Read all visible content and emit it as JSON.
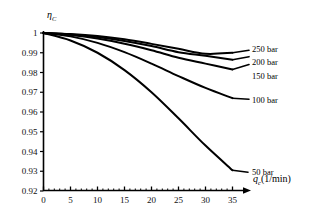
{
  "chart_data": {
    "type": "line",
    "title": "",
    "xlabel": "q_c(1/min)",
    "ylabel": "eta_C",
    "xlim": [
      0,
      35
    ],
    "ylim": [
      0.92,
      1.0
    ],
    "grid": false,
    "legend_position": "inline-right",
    "x_ticks": [
      0,
      5,
      10,
      15,
      20,
      25,
      30,
      35
    ],
    "x_tick_labels": [
      "0",
      "5",
      "10",
      "15",
      "20",
      "25",
      "30",
      "35"
    ],
    "y_ticks": [
      0.92,
      0.93,
      0.94,
      0.95,
      0.96,
      0.97,
      0.98,
      0.99,
      1.0
    ],
    "y_tick_labels": [
      "0.92",
      "0.93",
      "0.94",
      "0.95",
      "0.96",
      "0.97",
      "0.98",
      "0.99",
      "1"
    ],
    "x": [
      0,
      5,
      10,
      15,
      20,
      25,
      30,
      35
    ],
    "series": [
      {
        "name": "250 bar",
        "values": [
          1.0,
          0.9995,
          0.9985,
          0.9968,
          0.9945,
          0.992,
          0.9895,
          0.99
        ]
      },
      {
        "name": "200 bar",
        "values": [
          1.0,
          0.9993,
          0.998,
          0.996,
          0.9934,
          0.9903,
          0.9885,
          0.9865
        ]
      },
      {
        "name": "150 bar",
        "values": [
          1.0,
          0.999,
          0.9972,
          0.9946,
          0.9913,
          0.9875,
          0.9845,
          0.9815
        ]
      },
      {
        "name": "100 bar",
        "values": [
          1.0,
          0.9983,
          0.995,
          0.9903,
          0.9845,
          0.9782,
          0.9722,
          0.967
        ]
      },
      {
        "name": "50 bar",
        "values": [
          1.0,
          0.9962,
          0.99,
          0.9812,
          0.97,
          0.9568,
          0.943,
          0.9305
        ]
      }
    ]
  },
  "axis": {
    "y_label_symbol": "η",
    "y_label_sub": "C",
    "x_label_symbol": "q",
    "x_label_sub": "c",
    "x_label_unit": "(1/min)"
  },
  "series_labels": {
    "s250": "250 bar",
    "s200": "200 bar",
    "s150": "150 bar",
    "s100": "100 bar",
    "s50": "50 bar"
  },
  "colors": {
    "line": "#000000",
    "axis": "#000000",
    "background": "#ffffff"
  }
}
